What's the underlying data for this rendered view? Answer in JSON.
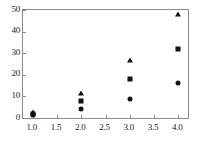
{
  "chart_data": {
    "type": "scatter",
    "title": "",
    "xlabel": "",
    "ylabel": "",
    "xlim": [
      0.8,
      4.2
    ],
    "ylim": [
      0,
      50
    ],
    "grid": false,
    "legend": "none",
    "xticks": [
      "1.0",
      "1.5",
      "2.0",
      "2.5",
      "3.0",
      "3.5",
      "4.0"
    ],
    "xtick_values": [
      1.0,
      1.5,
      2.0,
      2.5,
      3.0,
      3.5,
      4.0
    ],
    "yticks": [
      "0",
      "10",
      "20",
      "30",
      "40",
      "50"
    ],
    "ytick_values": [
      0,
      10,
      20,
      30,
      40,
      50
    ],
    "marker_color": "#111111",
    "frame_color": "#8a8a8a",
    "background": "#ffffff",
    "series": [
      {
        "name": "triangle-series",
        "marker": "triangle",
        "x": [
          1.0,
          2.0,
          3.0,
          4.0
        ],
        "values": [
          2.6,
          11.5,
          27.0,
          48.0
        ]
      },
      {
        "name": "square-series",
        "marker": "square",
        "x": [
          1.0,
          2.0,
          3.0,
          4.0
        ],
        "values": [
          2.0,
          8.0,
          18.0,
          31.8
        ]
      },
      {
        "name": "circle-series",
        "marker": "circle",
        "x": [
          1.0,
          2.0,
          3.0,
          4.0
        ],
        "values": [
          1.3,
          4.0,
          9.0,
          16.0
        ]
      }
    ]
  }
}
